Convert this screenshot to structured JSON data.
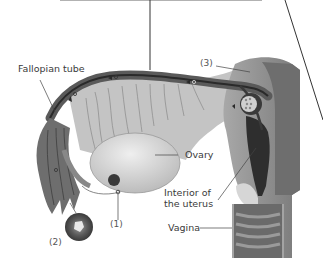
{
  "diagram": {
    "labels": {
      "fallopian_tube": "Fallopian tube",
      "ovary": "Ovary",
      "interior_uterus_line1": "Interior of",
      "interior_uterus_line2": "the uterus",
      "vagina": "Vagina"
    },
    "markers": {
      "m1": "(1)",
      "m2": "(2)",
      "m3": "(3)"
    },
    "colors": {
      "tube_dark": "#5a5a5a",
      "tissue_mid": "#9a9a9a",
      "tissue_light": "#c9c9c9",
      "ovary": "#d2d2d2",
      "uterus_wall": "#8e8e8e",
      "uterus_cavity": "#2e2e2e",
      "label_text": "#3a3a3a",
      "line": "#444444"
    }
  }
}
